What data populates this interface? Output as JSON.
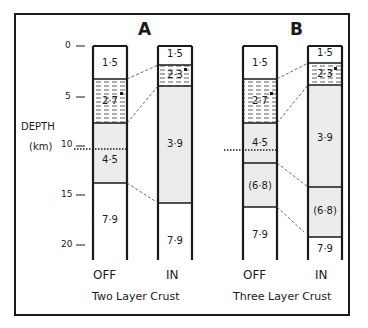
{
  "panels": [
    {
      "id": "A",
      "label": "A",
      "caption": "Two Layer Crust",
      "columns": [
        {
          "label": "OFF",
          "layers": [
            "1·5",
            "2·7",
            "4·5",
            "7·9"
          ]
        },
        {
          "label": "IN",
          "layers": [
            "1·5",
            "2·3",
            "3·9",
            "7·9"
          ]
        }
      ]
    },
    {
      "id": "B",
      "label": "B",
      "caption": "Three Layer Crust",
      "columns": [
        {
          "label": "OFF",
          "layers": [
            "1·5",
            "2·7",
            "4·5",
            "(6·8)",
            "7·9"
          ]
        },
        {
          "label": "IN",
          "layers": [
            "1·5",
            "2·3",
            "3·9",
            "(6·8)",
            "7·9"
          ]
        }
      ]
    }
  ],
  "axis": {
    "title": "DEPTH",
    "unit": "(km)",
    "ticks": [
      "0",
      "5",
      "10",
      "15",
      "20"
    ]
  },
  "colors": {
    "line": "#1a1a1a",
    "shaded": "#ececec",
    "white": "#ffffff"
  }
}
